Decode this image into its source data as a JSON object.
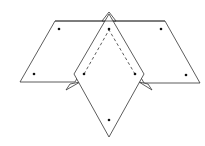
{
  "figure": {
    "stroke_color": "#333333",
    "dot_color": "#111111",
    "shapes": {
      "left_parallelogram": [
        [
          55,
          21
        ],
        [
          109,
          21
        ],
        [
          75,
          82
        ],
        [
          20,
          82
        ]
      ],
      "right_parallelogram": [
        [
          109,
          21
        ],
        [
          165,
          21
        ],
        [
          200,
          83
        ],
        [
          144,
          83
        ]
      ],
      "top_tab": [
        [
          109,
          13
        ],
        [
          115,
          21
        ],
        [
          103,
          21
        ]
      ],
      "rhombus": [
        [
          109,
          21
        ],
        [
          144,
          74
        ],
        [
          109,
          137
        ],
        [
          74,
          74
        ]
      ],
      "left_tab": [
        [
          80,
          82
        ],
        [
          66,
          89
        ],
        [
          69,
          84
        ]
      ],
      "right_tab": [
        [
          140,
          82
        ],
        [
          152,
          90
        ],
        [
          149,
          84
        ]
      ],
      "dashed_path": [
        [
          84,
          74
        ],
        [
          109,
          30
        ],
        [
          135,
          74
        ]
      ]
    },
    "dots": [
      [
        59,
        29
      ],
      [
        34,
        74
      ],
      [
        109,
        29
      ],
      [
        84,
        74
      ],
      [
        135,
        74
      ],
      [
        161,
        29
      ],
      [
        186,
        75
      ],
      [
        109,
        120
      ]
    ]
  }
}
